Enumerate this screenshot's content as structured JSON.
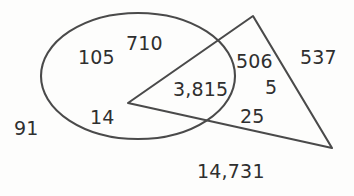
{
  "figure": {
    "type": "venn-euler-diagram",
    "background_color": "#fdfdfc",
    "stroke_color": "#4a4a4a",
    "text_color": "#2f2f2f"
  },
  "shapes": {
    "ellipse": {
      "name": "ellipse",
      "cx": 138,
      "cy": 76,
      "rx": 97,
      "ry": 63
    },
    "triangle": {
      "name": "triangle",
      "points": "253,16 332,148 128,103"
    }
  },
  "labels": {
    "ellipse_only_left": "105",
    "ellipse_only_top": "710",
    "ellipse_only_bottom": "14",
    "intersection": "3,815",
    "triangle_only_upper": "506",
    "triangle_only_middle": "5",
    "triangle_only_lower": "25",
    "triangle_outside_right": "537",
    "outside_left": "91",
    "outside_bottom": "14,731"
  },
  "chart_data": {
    "type": "table",
    "title": "",
    "categories": [
      "ellipse only (left)",
      "ellipse only (top)",
      "ellipse only (bottom)",
      "ellipse ∩ triangle",
      "triangle only (upper)",
      "triangle only (middle)",
      "triangle only (lower)",
      "outside right",
      "outside left",
      "outside bottom"
    ],
    "values": [
      105,
      710,
      14,
      3815,
      506,
      5,
      25,
      537,
      91,
      14731
    ],
    "value_labels": [
      "105",
      "710",
      "14",
      "3,815",
      "506",
      "5",
      "25",
      "537",
      "91",
      "14,731"
    ],
    "xlabel": "",
    "ylabel": ""
  }
}
